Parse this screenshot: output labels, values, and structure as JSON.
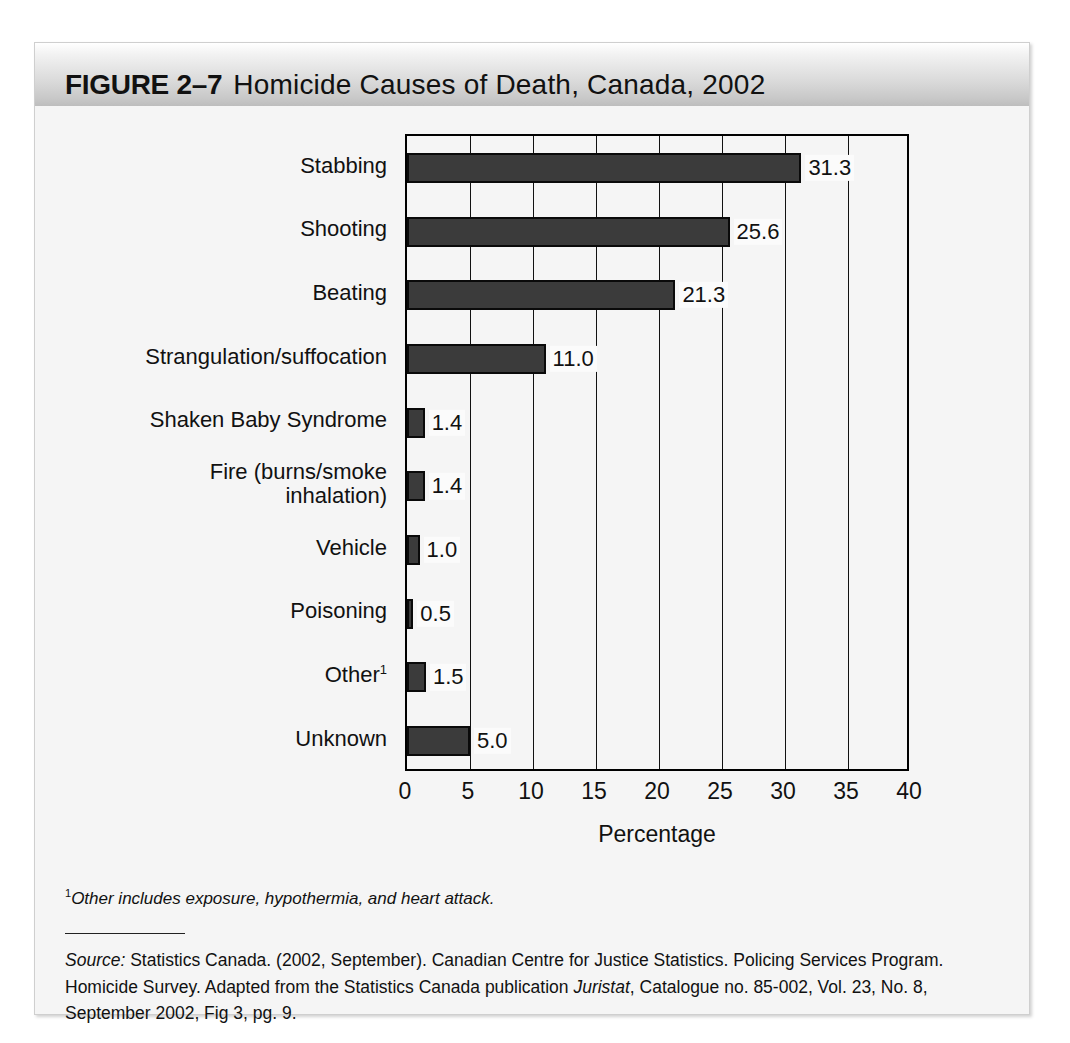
{
  "figure": {
    "label": "FIGURE 2–7",
    "title": "Homicide Causes of Death, Canada, 2002"
  },
  "footnote": {
    "marker": "1",
    "text": "Other includes exposure, hypothermia, and heart attack."
  },
  "source": {
    "label": "Source:",
    "part1": " Statistics Canada. (2002, September). Canadian Centre for Justice Statistics. Policing Services Program. Homicide Survey. Adapted from the Statistics Canada publication ",
    "publication": "Juristat",
    "part2": ", Catalogue no. 85-002, Vol. 23, No. 8, September 2002, Fig 3, pg. 9."
  },
  "colors": {
    "bar_fill": "#3b3b3b",
    "bar_stroke": "#0a0a0a",
    "panel_background": "#f5f5f5",
    "axis": "#000000"
  },
  "chart_data": {
    "type": "bar",
    "orientation": "horizontal",
    "title": "Homicide Causes of Death, Canada, 2002",
    "xlabel": "Percentage",
    "ylabel": "",
    "xlim": [
      0,
      40
    ],
    "xticks": [
      0,
      5,
      10,
      15,
      20,
      25,
      30,
      35,
      40
    ],
    "grid": "vertical",
    "legend": "none",
    "categories": [
      "Stabbing",
      "Shooting",
      "Beating",
      "Strangulation/suffocation",
      "Shaken Baby Syndrome",
      "Fire (burns/smoke inhalation)",
      "Vehicle",
      "Poisoning",
      "Other",
      "Unknown"
    ],
    "values": [
      31.3,
      25.6,
      21.3,
      11.0,
      1.4,
      1.4,
      1.0,
      0.5,
      1.5,
      5.0
    ],
    "value_labels": [
      "31.3",
      "25.6",
      "21.3",
      "11.0",
      "1.4",
      "1.4",
      "1.0",
      "0.5",
      "1.5",
      "5.0"
    ],
    "category_footnote_markers": [
      "",
      "",
      "",
      "",
      "",
      "",
      "",
      "",
      "1",
      ""
    ],
    "category_label_lines": [
      [
        "Stabbing"
      ],
      [
        "Shooting"
      ],
      [
        "Beating"
      ],
      [
        "Strangulation/suffocation"
      ],
      [
        "Shaken Baby Syndrome"
      ],
      [
        "Fire (burns/smoke",
        "inhalation)"
      ],
      [
        "Vehicle"
      ],
      [
        "Poisoning"
      ],
      [
        "Other"
      ],
      [
        "Unknown"
      ]
    ]
  }
}
